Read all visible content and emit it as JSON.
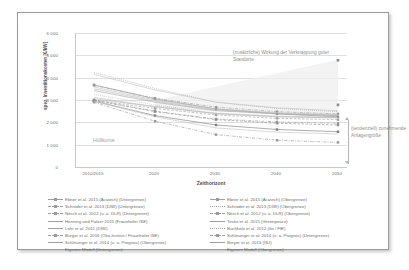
{
  "figure": {
    "annotations": {
      "envelope_label": "Hüllkurve",
      "top_right": "(zusätzliche) Wirkung der Verknappung guter Standorte",
      "right_side": "(tendenziell) zunehmende Anlagengröße"
    }
  },
  "chart_data": {
    "type": "line",
    "title": "",
    "xlabel": "Zeithorizont",
    "ylabel": "spez. Investitionskosten [€/kW]",
    "categories": [
      "2010/2015",
      "2020",
      "2030",
      "2040",
      "2050"
    ],
    "xticklabels": [
      "2010/2015",
      "2020",
      "2030",
      "2040",
      "2050"
    ],
    "yticklabels": [
      "0",
      "1 000",
      "2 000",
      "3 000",
      "4 000",
      "5 000",
      "6 000"
    ],
    "yticks": [
      0,
      1000,
      2000,
      3000,
      4000,
      5000,
      6000
    ],
    "ylim": [
      0,
      6000
    ],
    "grid": true,
    "legend_position": "bottom",
    "accent_color": "#8f8f8f",
    "series": [
      {
        "name": "Ebner et al. 2015 (Acatech) (Untergrenze)",
        "style": "solid-marker",
        "color": "#7a7a7a",
        "values": [
          2950,
          2300,
          1880,
          1680,
          1580
        ]
      },
      {
        "name": "Ebner et al. 2015 (Acatech) (Obergrenze)",
        "style": "solid-marker",
        "color": "#8a8a8a",
        "values": [
          3680,
          3050,
          2600,
          2380,
          2250
        ]
      },
      {
        "name": "Schröder et al. 2013 (DIW) (Untergrenze)",
        "style": "dashed-marker",
        "color": "#a0a0a0",
        "values": [
          3000,
          2620,
          2330,
          2180,
          2120
        ]
      },
      {
        "name": "Schröder et al. 2013 (DIW) (Obergrenze)",
        "style": "dotted",
        "color": "#9c9c9c",
        "values": [
          4230,
          3520,
          2900,
          2620,
          2480
        ]
      },
      {
        "name": "Nitsch et al. 2012 (u. a. DLR) (Untergrenze)",
        "style": "dash-dot-marker",
        "color": "#9a9a9a",
        "values": [
          3000,
          2500,
          2150,
          2020,
          1960
        ]
      },
      {
        "name": "Nitsch et al. 2012 (u. a. DLR) (Obergrenze)",
        "style": "dash-dot-marker",
        "color": "#9a9a9a",
        "values": [
          3650,
          3080,
          2680,
          2480,
          2380
        ]
      },
      {
        "name": "Henning und Palzer 2015 (Fraunhofer ISE)",
        "style": "solid",
        "color": "#b0b0b0",
        "values": [
          3050,
          2700,
          2400,
          2260,
          2200
        ]
      },
      {
        "name": "Teske et al. 2015 (Greenpeace)",
        "style": "solid",
        "color": "#b4b4b4",
        "values": [
          3500,
          2950,
          2550,
          2400,
          2320
        ]
      },
      {
        "name": "Lehr et al. 2011 (DIW)",
        "style": "solid",
        "color": "#bdbdbd",
        "values": [
          3580,
          3000,
          2600,
          2430,
          2350
        ]
      },
      {
        "name": "Buchholz et al. 2012 (ifo / FfE)",
        "style": "dotted",
        "color": "#adadad",
        "values": [
          3250,
          2780,
          2420,
          2280,
          2220
        ]
      },
      {
        "name": "Bürger et al. 2016 (Öko-Institut / Fraunhofer ISE)",
        "style": "dashed-marker",
        "color": "#8e8e8e",
        "values": [
          2980,
          2480,
          2120,
          1960,
          1880
        ]
      },
      {
        "name": "Schlesinger et al. 2014 (u. a. Prognos) (Untergrenze)",
        "style": "dash-dot-marker",
        "color": "#969696",
        "values": [
          2900,
          2050,
          1450,
          1200,
          1100
        ]
      },
      {
        "name": "Schlesinger et al. 2014 (u. a. Prognos) (Obergrenze)",
        "style": "solid",
        "color": "#a8a8a8",
        "values": [
          3420,
          2900,
          2520,
          2380,
          2300
        ]
      },
      {
        "name": "Breyer et al. 2013 (ISJ)",
        "style": "solid",
        "color": "#bcbcbc",
        "values": [
          3120,
          2700,
          2380,
          2250,
          2200
        ]
      },
      {
        "name": "Eigenes Modell (Untergrenze)",
        "style": "solid",
        "color": "#c2c2c2",
        "values": [
          2950,
          2250,
          1750,
          1560,
          1480
        ]
      },
      {
        "name": "Eigenes Modell (Obergrenze)",
        "style": "solid",
        "color": "#c2c2c2",
        "values": [
          4150,
          3450,
          2900,
          2650,
          2520
        ]
      }
    ],
    "scatter_points": [
      {
        "x": "2050",
        "y": 4780,
        "note": "Obergrenze Verknappung"
      },
      {
        "x": "2050",
        "y": 2780,
        "note": "mittlere Ausprägung"
      }
    ],
    "legend_left": [
      {
        "label": "Ebner et al. 2015 (Acatech) (Untergrenze)",
        "style": "solid-marker"
      },
      {
        "label": "Schröder et al. 2013 (DIW) (Untergrenze)",
        "style": "dashed-marker"
      },
      {
        "label": "Nitsch et al. 2012 (u. a. DLR) (Untergrenze)",
        "style": "dash-dot-marker"
      },
      {
        "label": "Henning und Palzer 2015 (Fraunhofer ISE)",
        "style": "solid"
      },
      {
        "label": "Lehr et al. 2011 (DIW)",
        "style": "solid"
      },
      {
        "label": "Bürger et al. 2016 (Öko-Institut / Fraunhofer ISE)",
        "style": "dashed-marker"
      },
      {
        "label": "Schlesinger et al. 2014 (u. a. Prognos) (Obergrenze)",
        "style": "solid"
      },
      {
        "label": "Eigenes Modell (Untergrenze)",
        "style": "solid"
      }
    ],
    "legend_right": [
      {
        "label": "Ebner et al. 2015 (Acatech) (Obergrenze)",
        "style": "solid-marker"
      },
      {
        "label": "Schröder et al. 2013 (DIW) (Obergrenze)",
        "style": "dotted"
      },
      {
        "label": "Nitsch et al. 2012 (u. a. DLR) (Obergrenze)",
        "style": "dash-dot-marker"
      },
      {
        "label": "Teske et al. 2015 (Greenpeace)",
        "style": "solid"
      },
      {
        "label": "Buchholz et al. 2012 (ifo / FfE)",
        "style": "dotted"
      },
      {
        "label": "Schlesinger et al. 2014 (u. a. Prognos) (Untergrenze)",
        "style": "dash-dot-marker"
      },
      {
        "label": "Breyer et al. 2013 (ISJ)",
        "style": "solid"
      },
      {
        "label": "Eigenes Modell (Obergrenze)",
        "style": "solid"
      }
    ]
  }
}
